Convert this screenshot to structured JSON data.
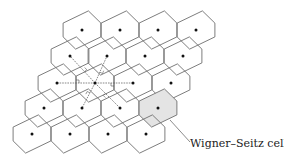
{
  "diagram": {
    "label": "Wigner–Seitz cell",
    "colors": {
      "cell_stroke": "#6e6e6e",
      "point_fill": "#111111",
      "construction_line": "#555555",
      "shaded_cell": "#e4e4e4",
      "text": "#222222"
    },
    "lattice": {
      "origin": [
        95,
        83
      ],
      "a1": [
        37.8,
        0
      ],
      "a2": [
        -12.5,
        -26
      ],
      "rows": [
        {
          "row": 0,
          "points_x": [
            82,
            120,
            158,
            196
          ],
          "y": 30
        },
        {
          "row": 1,
          "points_x": [
            70,
            107,
            145,
            183
          ],
          "y": 56
        },
        {
          "row": 2,
          "points_x": [
            57,
            95,
            133,
            171
          ],
          "y": 83
        },
        {
          "row": 3,
          "points_x": [
            44,
            82,
            120,
            158
          ],
          "y": 108
        },
        {
          "row": 4,
          "points_x": [
            32,
            70,
            108,
            146
          ],
          "y": 134
        }
      ]
    },
    "central_point": [
      95,
      83
    ],
    "nearest_neighbors": [
      [
        57,
        83
      ],
      [
        133,
        83
      ],
      [
        70,
        56
      ],
      [
        107,
        56
      ],
      [
        82,
        108
      ],
      [
        120,
        108
      ]
    ],
    "highlighted_cell_center": [
      158,
      108
    ],
    "label_position": [
      190,
      147
    ],
    "leader_line": {
      "from": [
        170,
        120
      ],
      "to": [
        190,
        142
      ]
    }
  }
}
